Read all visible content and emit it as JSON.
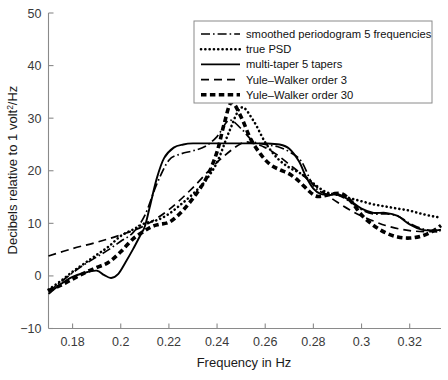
{
  "chart_data": {
    "type": "line",
    "title": "",
    "xlabel": "Frequency in Hz",
    "ylabel": "Decibels relative to 1 volt²/Hz",
    "xlim": [
      0.17,
      0.333
    ],
    "ylim": [
      -10,
      50
    ],
    "xticks": [
      0.18,
      0.2,
      0.22,
      0.24,
      0.26,
      0.28,
      0.3,
      0.32
    ],
    "xticklabels": [
      "0.18",
      "0.2",
      "0.22",
      "0.24",
      "0.26",
      "0.28",
      "0.3",
      "0.32"
    ],
    "yticks": [
      -10,
      0,
      10,
      20,
      30,
      40,
      50
    ],
    "yticklabels": [
      "−10",
      "0",
      "10",
      "20",
      "30",
      "40",
      "50"
    ],
    "grid": false,
    "legend_position": "top-right",
    "series": [
      {
        "name": "smoothed periodogram 5 frequencies",
        "style": "dashdot",
        "x": [
          0.17,
          0.175,
          0.18,
          0.185,
          0.19,
          0.195,
          0.2,
          0.205,
          0.21,
          0.215,
          0.22,
          0.225,
          0.23,
          0.235,
          0.24,
          0.245,
          0.25,
          0.255,
          0.26,
          0.265,
          0.27,
          0.275,
          0.28,
          0.285,
          0.29,
          0.295,
          0.3,
          0.305,
          0.31,
          0.315,
          0.32,
          0.325,
          0.33,
          0.333
        ],
        "y": [
          -3.0,
          -1.2,
          0.6,
          2.2,
          3.6,
          5.0,
          6.6,
          8.2,
          11.5,
          17.5,
          22.0,
          23.2,
          23.8,
          24.6,
          26.5,
          29.6,
          28.0,
          25.6,
          25.0,
          24.6,
          23.6,
          21.8,
          17.2,
          15.6,
          15.4,
          14.2,
          12.6,
          11.8,
          11.8,
          11.4,
          10.0,
          9.0,
          8.6,
          8.6
        ]
      },
      {
        "name": "true PSD",
        "style": "dotted",
        "x": [
          0.17,
          0.175,
          0.18,
          0.185,
          0.19,
          0.195,
          0.2,
          0.205,
          0.21,
          0.215,
          0.22,
          0.225,
          0.23,
          0.235,
          0.24,
          0.245,
          0.25,
          0.255,
          0.26,
          0.265,
          0.27,
          0.275,
          0.28,
          0.285,
          0.29,
          0.295,
          0.3,
          0.305,
          0.31,
          0.315,
          0.32,
          0.325,
          0.33,
          0.333
        ],
        "y": [
          -2.6,
          -1.0,
          0.8,
          2.4,
          4.0,
          5.6,
          7.6,
          8.8,
          10.0,
          10.6,
          11.8,
          13.6,
          15.6,
          18.0,
          21.6,
          27.4,
          32.0,
          29.6,
          25.4,
          22.4,
          20.6,
          19.4,
          17.6,
          16.0,
          15.4,
          14.8,
          14.2,
          13.6,
          13.2,
          12.8,
          12.4,
          11.8,
          11.3,
          11.1
        ]
      },
      {
        "name": "multi-taper 5 tapers",
        "style": "solid",
        "x": [
          0.17,
          0.175,
          0.18,
          0.185,
          0.19,
          0.193,
          0.196,
          0.199,
          0.202,
          0.205,
          0.208,
          0.21,
          0.212,
          0.215,
          0.218,
          0.222,
          0.226,
          0.23,
          0.24,
          0.25,
          0.26,
          0.266,
          0.27,
          0.274,
          0.277,
          0.28,
          0.283,
          0.287,
          0.29,
          0.295,
          0.3,
          0.305,
          0.31,
          0.315,
          0.32,
          0.325,
          0.33,
          0.333
        ],
        "y": [
          -3.4,
          -1.6,
          -0.2,
          0.6,
          1.0,
          0.2,
          -0.4,
          0.4,
          2.6,
          5.0,
          7.6,
          9.4,
          13.0,
          18.6,
          22.4,
          24.4,
          25.0,
          25.2,
          25.2,
          25.2,
          25.2,
          25.0,
          24.2,
          21.8,
          18.8,
          16.6,
          15.6,
          15.4,
          15.6,
          14.4,
          12.8,
          12.0,
          12.0,
          11.4,
          9.8,
          8.8,
          8.6,
          8.8
        ]
      },
      {
        "name": "Yule–Walker order 3",
        "style": "dashed",
        "x": [
          0.17,
          0.18,
          0.19,
          0.2,
          0.21,
          0.22,
          0.23,
          0.24,
          0.25,
          0.255,
          0.26,
          0.265,
          0.27,
          0.275,
          0.28,
          0.285,
          0.29,
          0.295,
          0.3,
          0.31,
          0.32,
          0.33,
          0.333
        ],
        "y": [
          3.8,
          5.2,
          6.4,
          7.8,
          9.6,
          12.6,
          16.8,
          21.6,
          25.2,
          25.2,
          24.4,
          23.0,
          21.2,
          19.4,
          17.4,
          15.6,
          14.0,
          12.6,
          11.4,
          9.6,
          8.6,
          8.4,
          8.4
        ]
      },
      {
        "name": "Yule–Walker order 30",
        "style": "thickdashed",
        "x": [
          0.17,
          0.175,
          0.18,
          0.185,
          0.19,
          0.195,
          0.2,
          0.205,
          0.21,
          0.213,
          0.216,
          0.22,
          0.224,
          0.228,
          0.232,
          0.236,
          0.24,
          0.243,
          0.246,
          0.25,
          0.254,
          0.258,
          0.262,
          0.266,
          0.27,
          0.274,
          0.278,
          0.281,
          0.284,
          0.288,
          0.292,
          0.296,
          0.3,
          0.305,
          0.31,
          0.315,
          0.32,
          0.325,
          0.33,
          0.333
        ],
        "y": [
          -2.8,
          -1.8,
          -0.6,
          0.6,
          1.6,
          2.6,
          4.6,
          7.0,
          8.6,
          9.4,
          9.8,
          10.2,
          11.6,
          13.6,
          16.0,
          19.0,
          23.6,
          29.0,
          33.0,
          30.2,
          26.0,
          23.2,
          21.2,
          20.2,
          19.4,
          18.0,
          16.2,
          15.2,
          15.2,
          15.6,
          15.6,
          14.0,
          11.6,
          9.6,
          8.2,
          7.4,
          7.2,
          7.6,
          8.6,
          9.6
        ]
      }
    ]
  },
  "legend": {
    "items": [
      {
        "label": "smoothed periodogram 5 frequencies",
        "style": "dashdot"
      },
      {
        "label": "true PSD",
        "style": "dotted"
      },
      {
        "label": "multi-taper 5 tapers",
        "style": "solid"
      },
      {
        "label": "Yule–Walker order 3",
        "style": "dashed"
      },
      {
        "label": "Yule–Walker order 30",
        "style": "thickdashed"
      }
    ]
  },
  "axes": {
    "x_title": "Frequency in Hz",
    "y_title_main": "Decibels relative to 1 volt",
    "y_title_sup": "2",
    "y_title_tail": "/Hz"
  },
  "colors": {
    "curve": "#000000",
    "axis": "#8a8a8a",
    "text": "#1a1a1a",
    "background": "#ffffff"
  }
}
